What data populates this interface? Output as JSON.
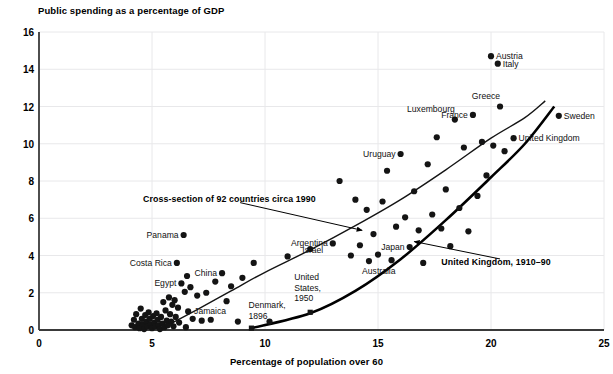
{
  "chart_data": {
    "type": "scatter",
    "title": "Public spending as a percentage of GDP",
    "xlabel": "Percentage of population over 60",
    "ylabel": "Public spending as a percentage of GDP",
    "xlim": [
      0,
      25
    ],
    "ylim": [
      0,
      16
    ],
    "xticks": [
      0,
      5,
      10,
      15,
      20,
      25
    ],
    "yticks": [
      0,
      2,
      4,
      6,
      8,
      10,
      12,
      14,
      16
    ],
    "grid": "horizontal and vertical light gridlines",
    "legend": "none",
    "marker_color": "#111111",
    "series": [
      {
        "name": "Cross-section of 92 countries circa 1990",
        "type": "scatter",
        "marker": "circle",
        "points": [
          [
            4.1,
            0.25
          ],
          [
            4.2,
            0.55
          ],
          [
            4.25,
            0.15
          ],
          [
            4.3,
            0.85
          ],
          [
            4.4,
            0.35
          ],
          [
            4.45,
            0.1
          ],
          [
            4.5,
            1.15
          ],
          [
            4.55,
            0.6
          ],
          [
            4.6,
            0.3
          ],
          [
            4.65,
            0.05
          ],
          [
            4.7,
            0.8
          ],
          [
            4.75,
            0.45
          ],
          [
            4.8,
            0.2
          ],
          [
            4.85,
            0.95
          ],
          [
            4.9,
            0.6
          ],
          [
            4.95,
            0.3
          ],
          [
            5.0,
            0.1
          ],
          [
            5.05,
            0.75
          ],
          [
            5.1,
            0.4
          ],
          [
            5.15,
            0.2
          ],
          [
            5.2,
            0.9
          ],
          [
            5.25,
            0.55
          ],
          [
            5.3,
            0.25
          ],
          [
            5.35,
            0.05
          ],
          [
            5.4,
            0.7
          ],
          [
            5.45,
            0.35
          ],
          [
            5.5,
            1.5
          ],
          [
            5.55,
            0.15
          ],
          [
            5.6,
            1.05
          ],
          [
            5.65,
            0.5
          ],
          [
            5.7,
            0.25
          ],
          [
            5.75,
            1.75
          ],
          [
            5.8,
            0.85
          ],
          [
            5.85,
            0.45
          ],
          [
            5.9,
            1.35
          ],
          [
            5.95,
            0.2
          ],
          [
            6.0,
            1.6
          ],
          [
            6.05,
            0.7
          ],
          [
            6.1,
            3.6
          ],
          [
            6.15,
            1.2
          ],
          [
            6.2,
            0.4
          ],
          [
            6.3,
            2.5
          ],
          [
            6.4,
            5.1
          ],
          [
            6.45,
            2.05
          ],
          [
            6.5,
            0.15
          ],
          [
            6.55,
            2.9
          ],
          [
            6.6,
            1.0
          ],
          [
            6.7,
            2.3
          ],
          [
            6.8,
            0.6
          ],
          [
            7.0,
            1.85
          ],
          [
            7.2,
            0.5
          ],
          [
            7.4,
            2.0
          ],
          [
            7.6,
            0.55
          ],
          [
            7.8,
            2.6
          ],
          [
            8.1,
            3.05
          ],
          [
            8.3,
            1.55
          ],
          [
            8.5,
            2.35
          ],
          [
            8.8,
            0.45
          ],
          [
            9.0,
            2.8
          ],
          [
            9.5,
            3.6
          ],
          [
            10.2,
            0.45
          ],
          [
            11.0,
            3.95
          ],
          [
            12.0,
            4.35
          ],
          [
            13.0,
            4.65
          ],
          [
            13.3,
            8.0
          ],
          [
            13.8,
            4.0
          ],
          [
            14.0,
            7.0
          ],
          [
            14.2,
            4.55
          ],
          [
            14.5,
            6.45
          ],
          [
            14.6,
            3.7
          ],
          [
            14.8,
            5.15
          ],
          [
            15.0,
            4.05
          ],
          [
            15.2,
            6.9
          ],
          [
            15.4,
            8.55
          ],
          [
            15.6,
            3.75
          ],
          [
            15.8,
            5.55
          ],
          [
            16.0,
            9.45
          ],
          [
            16.2,
            6.05
          ],
          [
            16.4,
            4.45
          ],
          [
            16.6,
            7.45
          ],
          [
            16.8,
            5.35
          ],
          [
            17.0,
            3.6
          ],
          [
            17.2,
            8.9
          ],
          [
            17.4,
            6.2
          ],
          [
            17.6,
            10.35
          ],
          [
            17.8,
            5.45
          ],
          [
            18.0,
            7.55
          ],
          [
            18.2,
            4.5
          ],
          [
            18.4,
            11.3
          ],
          [
            18.6,
            6.55
          ],
          [
            18.8,
            9.8
          ],
          [
            19.0,
            5.3
          ],
          [
            19.2,
            11.55
          ],
          [
            19.4,
            7.2
          ],
          [
            19.6,
            10.1
          ],
          [
            19.8,
            8.3
          ],
          [
            20.0,
            14.7
          ],
          [
            20.3,
            14.3
          ],
          [
            20.1,
            9.9
          ],
          [
            20.4,
            12.0
          ],
          [
            20.6,
            9.6
          ],
          [
            21.0,
            10.3
          ],
          [
            23.0,
            11.5
          ]
        ]
      },
      {
        "name": "United Kingdom, 1910-90",
        "type": "line",
        "marker": "square",
        "points": [
          [
            9.4,
            0.1
          ],
          [
            12.0,
            0.9
          ],
          [
            14.0,
            2.1
          ],
          [
            16.0,
            3.8
          ],
          [
            18.0,
            5.9
          ],
          [
            20.0,
            8.2
          ],
          [
            21.5,
            10.0
          ],
          [
            22.8,
            12.0
          ]
        ],
        "highlighted_points": [
          {
            "label": "Denmark, 1896",
            "x": 9.4,
            "y": 0.1
          },
          {
            "label": "United States, 1950",
            "x": 12.0,
            "y": 0.95
          }
        ]
      },
      {
        "name": "Cross-section fit curve",
        "type": "line",
        "points": [
          [
            5.6,
            0.2
          ],
          [
            7.0,
            1.1
          ],
          [
            8.5,
            2.1
          ],
          [
            10.0,
            3.1
          ],
          [
            12.0,
            4.3
          ],
          [
            14.0,
            5.6
          ],
          [
            16.0,
            7.0
          ],
          [
            18.0,
            8.6
          ],
          [
            20.0,
            10.3
          ],
          [
            21.5,
            11.4
          ],
          [
            22.4,
            12.3
          ]
        ]
      }
    ],
    "point_labels": [
      {
        "name": "Austria",
        "x": 20.0,
        "y": 14.7,
        "side": "right"
      },
      {
        "name": "Italy",
        "x": 20.3,
        "y": 14.3,
        "side": "right"
      },
      {
        "name": "Greece",
        "x": 20.4,
        "y": 12.0,
        "side": "above"
      },
      {
        "name": "Luxembourg",
        "x": 18.4,
        "y": 11.3,
        "side": "above"
      },
      {
        "name": "France",
        "x": 19.2,
        "y": 11.55,
        "side": "left"
      },
      {
        "name": "Sweden",
        "x": 23.0,
        "y": 11.5,
        "side": "right"
      },
      {
        "name": "United Kingdom",
        "x": 21.0,
        "y": 10.3,
        "side": "right"
      },
      {
        "name": "Uruguay",
        "x": 16.0,
        "y": 9.45,
        "side": "left"
      },
      {
        "name": "Japan",
        "x": 16.4,
        "y": 4.45,
        "side": "left"
      },
      {
        "name": "Australia",
        "x": 15.6,
        "y": 3.75,
        "side": "below"
      },
      {
        "name": "Argentina",
        "x": 13.0,
        "y": 4.65,
        "side": "left"
      },
      {
        "name": "Israel",
        "x": 12.8,
        "y": 4.3,
        "side": "left"
      },
      {
        "name": "Panama",
        "x": 6.4,
        "y": 5.1,
        "side": "left"
      },
      {
        "name": "Costa Rica",
        "x": 6.1,
        "y": 3.6,
        "side": "left"
      },
      {
        "name": "Egypt",
        "x": 6.3,
        "y": 2.5,
        "side": "left"
      },
      {
        "name": "China",
        "x": 8.1,
        "y": 3.05,
        "side": "left"
      },
      {
        "name": "Jamaica",
        "x": 8.5,
        "y": 1.0,
        "side": "left"
      },
      {
        "name": "Denmark, 1896",
        "x": 9.4,
        "y": 0.1,
        "side": "above"
      },
      {
        "name": "United States, 1950",
        "x": 12.0,
        "y": 0.95,
        "side": "above"
      }
    ],
    "annotations": [
      {
        "text": "Cross-section of 92 countries circa 1990",
        "arrow_from": [
          8.9,
          7.0
        ],
        "arrow_to": [
          14.3,
          5.35
        ]
      },
      {
        "text": "United Kingdom, 1910–90",
        "arrow_from": [
          20.4,
          3.6
        ],
        "arrow_to": [
          16.6,
          4.75
        ]
      }
    ]
  },
  "labels": {
    "title": "Public spending as a percentage of GDP",
    "xlabel": "Percentage of population over 60",
    "xticks": [
      "0",
      "5",
      "10",
      "15",
      "20",
      "25"
    ],
    "yticks": [
      "0",
      "2",
      "4",
      "6",
      "8",
      "10",
      "12",
      "14",
      "16"
    ],
    "annotation_cross_section": "Cross-section of 92 countries circa 1990",
    "annotation_uk": "United Kingdom, 1910–90",
    "pt_austria": "Austria",
    "pt_italy": "Italy",
    "pt_greece": "Greece",
    "pt_luxembourg": "Luxembourg",
    "pt_france": "France",
    "pt_sweden": "Sweden",
    "pt_united_kingdom": "United Kingdom",
    "pt_uruguay": "Uruguay",
    "pt_japan": "Japan",
    "pt_australia": "Australia",
    "pt_argentina": "Argentina",
    "pt_israel": "Israel",
    "pt_panama": "Panama",
    "pt_costa_rica": "Costa Rica",
    "pt_egypt": "Egypt",
    "pt_china": "China",
    "pt_jamaica": "Jamaica",
    "pt_denmark_l1": "Denmark,",
    "pt_denmark_l2": "1896",
    "pt_us_l1": "United",
    "pt_us_l2": "States,",
    "pt_us_l3": "1950"
  },
  "colors": {
    "marker": "#141414",
    "axis": "#3a3a3a",
    "grid": "#e8e8ea",
    "curve_thin": "#141414",
    "curve_thick": "#000000",
    "text": "#000000"
  }
}
